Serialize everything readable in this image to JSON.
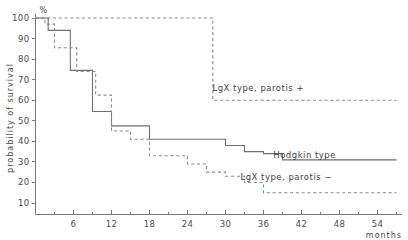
{
  "chart_data": {
    "type": "line",
    "title": "",
    "xlabel": "months",
    "ylabel": "probability of survival",
    "yunit": "%",
    "xlim": [
      0,
      57
    ],
    "ylim": [
      0,
      103
    ],
    "grid": false,
    "legend_position": "inline-right",
    "x_ticks_major": [
      6,
      12,
      18,
      24,
      30,
      36,
      42,
      48,
      54
    ],
    "x_ticks_minor": [
      3,
      9,
      15,
      21,
      27,
      33,
      39,
      45,
      51,
      57
    ],
    "x_tick_labels": [
      "6",
      "12",
      "18",
      "24",
      "30",
      "36",
      "42",
      "48",
      "54"
    ],
    "y_ticks": [
      10,
      20,
      30,
      40,
      50,
      60,
      70,
      80,
      90,
      100
    ],
    "y_tick_labels": [
      "10",
      "20",
      "30",
      "40",
      "50",
      "60",
      "70",
      "80",
      "90",
      "100"
    ],
    "series": [
      {
        "name": "LgX type, parotis +",
        "style": "dashed",
        "label_x": 304,
        "label_y": 91,
        "steps": [
          [
            0,
            100
          ],
          [
            28,
            100
          ],
          [
            28,
            60
          ],
          [
            57,
            60
          ]
        ]
      },
      {
        "name": "Hodgkin type",
        "style": "solid",
        "label_x": 336,
        "label_y": 158,
        "steps": [
          [
            0,
            100
          ],
          [
            2,
            100
          ],
          [
            2,
            94
          ],
          [
            5.5,
            94
          ],
          [
            5.5,
            74.5
          ],
          [
            9,
            74.5
          ],
          [
            9,
            54.5
          ],
          [
            12,
            54.5
          ],
          [
            12,
            47.5
          ],
          [
            18,
            47.5
          ],
          [
            18,
            41
          ],
          [
            30,
            41
          ],
          [
            30,
            38
          ],
          [
            33,
            38
          ],
          [
            33,
            35
          ],
          [
            36,
            35
          ],
          [
            36,
            34
          ],
          [
            39,
            34
          ],
          [
            39,
            31
          ],
          [
            57,
            31
          ]
        ]
      },
      {
        "name": "LgX type, parotis −",
        "style": "dashed",
        "label_x": 332,
        "label_y": 180,
        "steps": [
          [
            0,
            100
          ],
          [
            1.5,
            100
          ],
          [
            1.5,
            97
          ],
          [
            3,
            97
          ],
          [
            3,
            85.5
          ],
          [
            6.5,
            85.5
          ],
          [
            6.5,
            74
          ],
          [
            9.5,
            74
          ],
          [
            9.5,
            62.5
          ],
          [
            12,
            62.5
          ],
          [
            12,
            45
          ],
          [
            15,
            45
          ],
          [
            15,
            41
          ],
          [
            18,
            41
          ],
          [
            18,
            33
          ],
          [
            24,
            33
          ],
          [
            24,
            29
          ],
          [
            27,
            29
          ],
          [
            27,
            25
          ],
          [
            30,
            25
          ],
          [
            30,
            23
          ],
          [
            33,
            23
          ],
          [
            33,
            20
          ],
          [
            36,
            20
          ],
          [
            36,
            15
          ],
          [
            57,
            15
          ]
        ]
      }
    ]
  }
}
